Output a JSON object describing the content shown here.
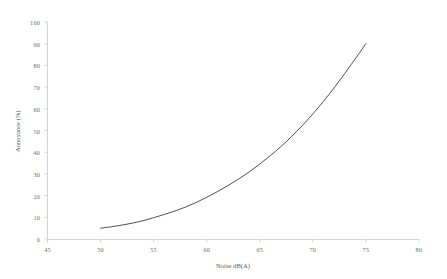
{
  "chart_data": {
    "type": "line",
    "title": "",
    "xlabel": "Noise dB(A)",
    "ylabel": "Annoyance (%)",
    "xlim": [
      45,
      80
    ],
    "ylim": [
      0,
      100
    ],
    "xticks": [
      45,
      50,
      55,
      60,
      65,
      70,
      75,
      80
    ],
    "xtick_labels": [
      "45",
      "50",
      "55",
      "60",
      "65",
      "70",
      "75",
      "80"
    ],
    "yticks": [
      0,
      10,
      20,
      30,
      40,
      50,
      60,
      70,
      80,
      90,
      100
    ],
    "ytick_labels": [
      "0",
      "10",
      "20",
      "30",
      "40",
      "50",
      "60",
      "70",
      "80",
      "90",
      "100"
    ],
    "grid": false,
    "legend": null,
    "line_color": "#3c3c3c",
    "axis_color": "#c9c9c9",
    "series": [
      {
        "name": "Annoyance vs Noise",
        "x": [
          50,
          51,
          52,
          53,
          54,
          55,
          56,
          57,
          58,
          59,
          60,
          61,
          62,
          63,
          64,
          65,
          66,
          67,
          68,
          69,
          70,
          71,
          72,
          73,
          74,
          75
        ],
        "values": [
          5,
          5.6,
          6.4,
          7.3,
          8.4,
          9.8,
          11.3,
          12.9,
          14.7,
          16.8,
          19.2,
          21.8,
          24.6,
          27.6,
          30.9,
          34.5,
          38.4,
          42.6,
          47.2,
          52.2,
          57.6,
          63.4,
          69.6,
          76.2,
          83.0,
          90.0
        ]
      }
    ]
  },
  "axes": {
    "x_axis_title": "Noise dB(A)",
    "y_axis_title": "Annoyance (%)"
  }
}
